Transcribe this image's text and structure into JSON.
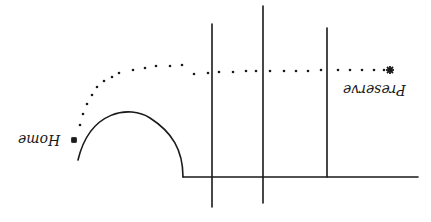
{
  "diagram": {
    "labels": {
      "start": "Home",
      "end": "Preserve"
    },
    "markers": {
      "start_icon": "asterisk",
      "end_icon": "asterisk"
    },
    "colors": {
      "ink": "#1a1a1a",
      "background": "#ffffff"
    },
    "orientation": "upside-down"
  }
}
